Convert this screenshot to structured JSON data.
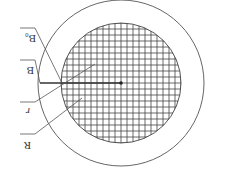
{
  "diagram": {
    "orientation": "rotated 180 degrees",
    "colors": {
      "background": "#ffffff",
      "outline": "#555555",
      "grid": "#444444",
      "label": "#333333"
    },
    "geometry": {
      "center": [
        121,
        83
      ],
      "outer_radius": 83,
      "inner_radius": 60,
      "grid_spacing": 6
    },
    "labels": [
      {
        "id": "B0",
        "text": "B₀",
        "points_to": "outer boundary"
      },
      {
        "id": "B",
        "text": "B",
        "points_to": "inner boundary"
      },
      {
        "id": "r",
        "text": "r",
        "points_to": "inner radius"
      },
      {
        "id": "R",
        "text": "R",
        "points_to": "outer radius"
      }
    ]
  }
}
